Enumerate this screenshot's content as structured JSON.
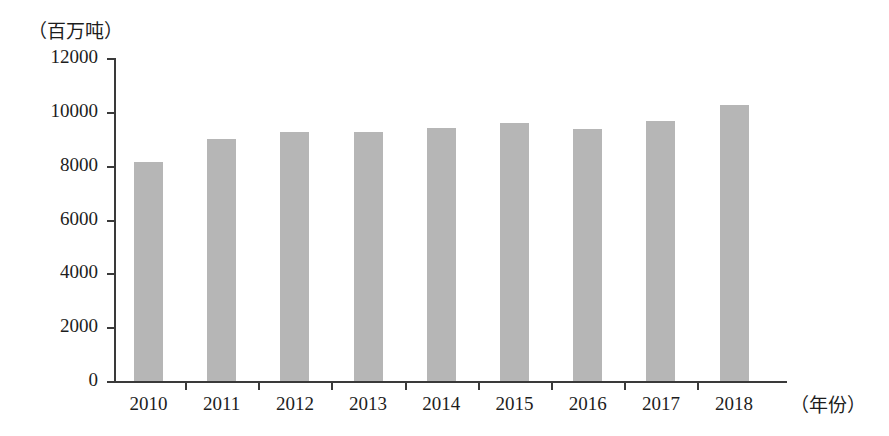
{
  "chart_data": {
    "type": "bar",
    "title": "",
    "subtitle": "",
    "unit_label": "（百万吨）",
    "xlabel": "（年份）",
    "ylabel": "",
    "categories": [
      "2010",
      "2011",
      "2012",
      "2013",
      "2014",
      "2015",
      "2016",
      "2017",
      "2018"
    ],
    "values": [
      8150,
      9000,
      9250,
      9250,
      9400,
      9600,
      9350,
      9650,
      10250
    ],
    "series": [
      {
        "name": "",
        "values": [
          8150,
          9000,
          9250,
          9250,
          9400,
          9600,
          9350,
          9650,
          10250
        ]
      }
    ],
    "ylim": [
      0,
      12000
    ],
    "ytick_labels": [
      "0",
      "2000",
      "4000",
      "6000",
      "8000",
      "10000",
      "12000"
    ],
    "ytick_values": [
      0,
      2000,
      4000,
      6000,
      8000,
      10000,
      12000
    ],
    "grid": false,
    "legend": false,
    "legend_position": "none",
    "bar_color": "#b6b6b6",
    "axis_color": "#3a3a3a",
    "text_color": "#1d1d1d",
    "background_color": "#ffffff"
  }
}
